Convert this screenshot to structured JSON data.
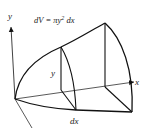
{
  "diagram": {
    "formula": "dV = πy² dx",
    "formula_parts": {
      "lhs": "dV = ",
      "pi": "π",
      "y": "y",
      "exp": "2",
      "dx": " dx"
    },
    "labels": {
      "y_axis": "y",
      "x_axis": "x",
      "radius": "y",
      "thickness": "dx"
    },
    "colors": {
      "stroke": "#111111",
      "text": "#222222",
      "background": "#ffffff"
    }
  }
}
